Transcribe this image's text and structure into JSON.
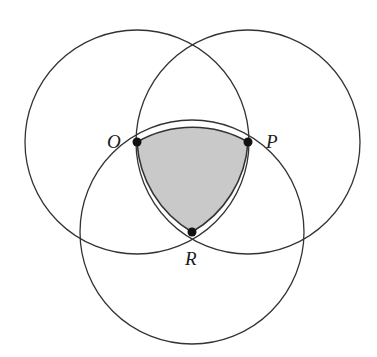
{
  "diagram": {
    "type": "three-circles-reuleaux",
    "radius": 112,
    "points": [
      {
        "id": "O",
        "label": "O",
        "x": 137,
        "y": 142
      },
      {
        "id": "P",
        "label": "P",
        "x": 248,
        "y": 142
      },
      {
        "id": "R",
        "label": "R",
        "x": 192,
        "y": 232
      }
    ],
    "circles": [
      {
        "center": "O"
      },
      {
        "center": "P"
      },
      {
        "center": "R"
      }
    ],
    "shaded_region": "intersection of all three circles (Reuleaux triangle OPR)",
    "colors": {
      "stroke": "#333333",
      "shade": "#c9c9c9",
      "point": "#111111"
    }
  },
  "labels": {
    "O": "O",
    "P": "P",
    "R": "R"
  }
}
